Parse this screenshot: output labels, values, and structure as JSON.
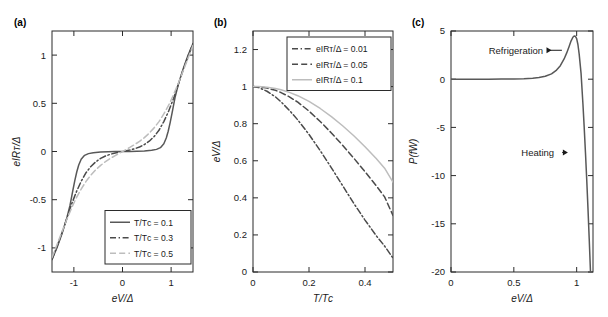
{
  "figure": {
    "panels": [
      "(a)",
      "(b)",
      "(c)"
    ]
  },
  "chart_data": [
    {
      "id": "panel-a",
      "type": "line",
      "tag": "(a)",
      "title": "",
      "xlabel": "eV/Δ",
      "ylabel": "eIRᴛ/Δ",
      "xlim": [
        -1.45,
        1.45
      ],
      "ylim": [
        -1.25,
        1.25
      ],
      "xticks": [
        -1,
        0,
        1
      ],
      "xticklabels": [
        "-1",
        "0",
        "1"
      ],
      "yticks": [
        -1,
        -0.5,
        0,
        0.5,
        1
      ],
      "yticklabels": [
        "-1",
        "-0.5",
        "0",
        "0.5",
        "1"
      ],
      "grid": false,
      "legend_position": "lower-right",
      "series": [
        {
          "name": "T/Tᴄ = 0.1",
          "style": "solid",
          "color": "#585858",
          "x": [
            -1.45,
            -1.35,
            -1.25,
            -1.15,
            -1.08,
            -1.02,
            -0.98,
            -0.94,
            -0.9,
            -0.85,
            -0.78,
            -0.7,
            -0.6,
            -0.45,
            -0.3,
            -0.15,
            0,
            0.15,
            0.3,
            0.45,
            0.6,
            0.7,
            0.78,
            0.85,
            0.9,
            0.94,
            0.98,
            1.02,
            1.08,
            1.15,
            1.25,
            1.35,
            1.45
          ],
          "y": [
            -1.12,
            -1.0,
            -0.86,
            -0.7,
            -0.56,
            -0.4,
            -0.3,
            -0.21,
            -0.14,
            -0.08,
            -0.04,
            -0.022,
            -0.012,
            -0.006,
            -0.003,
            -0.001,
            0,
            0.001,
            0.003,
            0.006,
            0.012,
            0.022,
            0.04,
            0.08,
            0.14,
            0.21,
            0.3,
            0.4,
            0.56,
            0.7,
            0.86,
            1.0,
            1.12
          ]
        },
        {
          "name": "T/Tᴄ = 0.3",
          "style": "dashdot",
          "color": "#4a4a4a",
          "x": [
            -1.45,
            -1.35,
            -1.25,
            -1.15,
            -1.05,
            -0.95,
            -0.85,
            -0.75,
            -0.65,
            -0.55,
            -0.45,
            -0.35,
            -0.25,
            -0.15,
            0,
            0.15,
            0.25,
            0.35,
            0.45,
            0.55,
            0.65,
            0.75,
            0.85,
            0.95,
            1.05,
            1.15,
            1.25,
            1.35,
            1.45
          ],
          "y": [
            -1.12,
            -0.99,
            -0.85,
            -0.7,
            -0.55,
            -0.42,
            -0.31,
            -0.22,
            -0.155,
            -0.107,
            -0.072,
            -0.047,
            -0.029,
            -0.015,
            0,
            0.015,
            0.029,
            0.047,
            0.072,
            0.107,
            0.155,
            0.22,
            0.31,
            0.42,
            0.55,
            0.7,
            0.85,
            0.99,
            1.12
          ]
        },
        {
          "name": "T/Tᴄ = 0.5",
          "style": "dashed",
          "color": "#bdbdbd",
          "x": [
            -1.45,
            -1.35,
            -1.25,
            -1.15,
            -1.05,
            -0.95,
            -0.85,
            -0.75,
            -0.65,
            -0.55,
            -0.45,
            -0.35,
            -0.25,
            -0.15,
            0,
            0.15,
            0.25,
            0.35,
            0.45,
            0.55,
            0.65,
            0.75,
            0.85,
            0.95,
            1.05,
            1.15,
            1.25,
            1.35,
            1.45
          ],
          "y": [
            -1.1,
            -0.97,
            -0.84,
            -0.71,
            -0.59,
            -0.48,
            -0.39,
            -0.31,
            -0.245,
            -0.19,
            -0.144,
            -0.105,
            -0.072,
            -0.042,
            0,
            0.042,
            0.072,
            0.105,
            0.144,
            0.19,
            0.245,
            0.31,
            0.39,
            0.48,
            0.59,
            0.71,
            0.84,
            0.97,
            1.1
          ]
        }
      ]
    },
    {
      "id": "panel-b",
      "type": "line",
      "tag": "(b)",
      "title": "",
      "xlabel": "T/Tᴄ",
      "ylabel": "eV/Δ",
      "xlim": [
        0,
        0.5
      ],
      "ylim": [
        0,
        1.3
      ],
      "xticks": [
        0,
        0.2,
        0.4
      ],
      "xticklabels": [
        "0",
        "0.2",
        "0.4"
      ],
      "yticks": [
        0,
        0.2,
        0.4,
        0.6,
        0.8,
        1,
        1.2
      ],
      "yticklabels": [
        "0",
        "0.2",
        "0.4",
        "0.6",
        "0.8",
        "1",
        "1.2"
      ],
      "grid": false,
      "legend_position": "upper-right",
      "series": [
        {
          "name": "eIRᴛ/Δ = 0.01",
          "style": "dashdot",
          "color": "#4a4a4a",
          "x": [
            0,
            0.02,
            0.05,
            0.08,
            0.1,
            0.13,
            0.16,
            0.2,
            0.24,
            0.28,
            0.32,
            0.36,
            0.4,
            0.44,
            0.47,
            0.5
          ],
          "y": [
            1.0,
            0.995,
            0.975,
            0.945,
            0.918,
            0.872,
            0.82,
            0.742,
            0.655,
            0.562,
            0.466,
            0.37,
            0.28,
            0.196,
            0.14,
            0.075
          ]
        },
        {
          "name": "eIRᴛ/Δ = 0.05",
          "style": "dashed",
          "color": "#4a4a4a",
          "x": [
            0,
            0.02,
            0.05,
            0.08,
            0.1,
            0.13,
            0.16,
            0.2,
            0.24,
            0.28,
            0.32,
            0.36,
            0.4,
            0.44,
            0.47,
            0.5
          ],
          "y": [
            1.0,
            0.999,
            0.992,
            0.98,
            0.968,
            0.945,
            0.916,
            0.868,
            0.812,
            0.75,
            0.684,
            0.614,
            0.541,
            0.466,
            0.405,
            0.305
          ]
        },
        {
          "name": "eIRᴛ/Δ = 0.1",
          "style": "solid",
          "color": "#bdbdbd",
          "x": [
            0,
            0.02,
            0.05,
            0.08,
            0.1,
            0.13,
            0.16,
            0.2,
            0.24,
            0.28,
            0.32,
            0.36,
            0.4,
            0.44,
            0.47,
            0.5
          ],
          "y": [
            1.0,
            1.0,
            0.997,
            0.99,
            0.983,
            0.969,
            0.951,
            0.92,
            0.882,
            0.838,
            0.789,
            0.735,
            0.676,
            0.612,
            0.56,
            0.485
          ]
        }
      ]
    },
    {
      "id": "panel-c",
      "type": "line",
      "tag": "(c)",
      "title": "",
      "xlabel": "eV/Δ",
      "ylabel": "P(fW)",
      "xlim": [
        0,
        1.13
      ],
      "ylim": [
        -20,
        5
      ],
      "xticks": [
        0,
        0.5,
        1
      ],
      "xticklabels": [
        "0",
        "0.5",
        "1"
      ],
      "yticks": [
        -20,
        -15,
        -10,
        -5,
        0,
        5
      ],
      "yticklabels": [
        "-20",
        "-15",
        "-10",
        "-5",
        "0",
        "5"
      ],
      "grid": false,
      "legend_position": "none",
      "annotations": [
        {
          "text": "Refrigeration",
          "x": 0.3,
          "y": 3.0,
          "arrow_to_x": 0.8
        },
        {
          "text": "Heating",
          "x": 0.56,
          "y": -7.6,
          "arrow_to_x": 0.93
        }
      ],
      "series": [
        {
          "name": "P",
          "style": "solid",
          "color": "#585858",
          "x": [
            0,
            0.1,
            0.2,
            0.3,
            0.4,
            0.5,
            0.58,
            0.65,
            0.7,
            0.75,
            0.8,
            0.84,
            0.87,
            0.9,
            0.92,
            0.94,
            0.955,
            0.97,
            0.98,
            0.99,
            1.0,
            1.01,
            1.02,
            1.035,
            1.05,
            1.06,
            1.07,
            1.08,
            1.09,
            1.1,
            1.11
          ],
          "y": [
            0.0,
            0.0,
            0.0,
            0.0,
            0.01,
            0.02,
            0.05,
            0.1,
            0.17,
            0.3,
            0.55,
            0.95,
            1.4,
            2.1,
            2.7,
            3.4,
            3.95,
            4.35,
            4.48,
            4.45,
            4.2,
            3.6,
            2.6,
            0.6,
            -2.6,
            -5.0,
            -7.6,
            -10.4,
            -13.4,
            -16.6,
            -20.0
          ]
        }
      ]
    }
  ]
}
